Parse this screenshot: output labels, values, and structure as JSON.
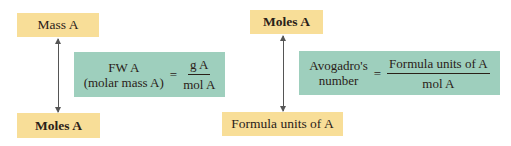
{
  "left": {
    "top_box": "Mass A",
    "bottom_box": "Moles A",
    "formula": {
      "lhs_line1": "FW A",
      "lhs_line2": "(molar mass A)",
      "equals": "=",
      "numerator": "g A",
      "denominator": "mol A"
    }
  },
  "right": {
    "top_box": "Moles A",
    "bottom_box": "Formula units of A",
    "formula": {
      "lhs_line1": "Avogadro's",
      "lhs_line2": "number",
      "equals": "=",
      "numerator": "Formula units of A",
      "denominator": "mol A"
    }
  },
  "colors": {
    "quantity_box": "#f8de98",
    "formula_box": "#9ecfbd",
    "arrow": "#555555"
  }
}
